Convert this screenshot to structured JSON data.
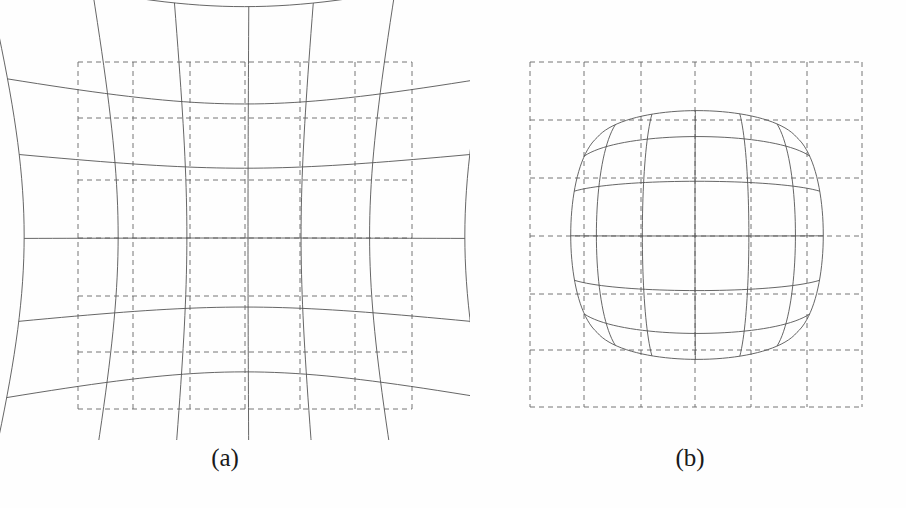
{
  "figure": {
    "background_color": "#fefefe",
    "solid_line_color": "#555555",
    "dashed_line_color": "#666666",
    "caption_color": "#1a1a1a",
    "panels": [
      {
        "id": "a",
        "caption": "(a)",
        "distortion_type": "pincushion",
        "description": "Pincushion distortion grid: solid curved grid bows inward toward the centre, overlaid on dashed ideal rectangular reference grid",
        "reference_grid": {
          "style": "dashed",
          "x_lines": [
            78,
            133,
            190,
            245,
            300,
            355,
            412
          ],
          "y_lines": [
            62,
            118,
            180,
            238,
            296,
            352,
            409
          ]
        },
        "distorted_grid": {
          "style": "solid",
          "nominal_x_lines": [
            62,
            128,
            188,
            248,
            300,
            360,
            427
          ],
          "nominal_y_lines": [
            48,
            115,
            170,
            238,
            305,
            360,
            424
          ],
          "corners": {
            "top_left": [
              48,
              32
            ],
            "top_right": [
              444,
              34
            ],
            "bottom_left": [
              50,
              430
            ],
            "bottom_right": [
              443,
              430
            ]
          },
          "distortion_coefficient": 0.22
        }
      },
      {
        "id": "b",
        "caption": "(b)",
        "distortion_type": "barrel",
        "description": "Barrel distortion grid: solid curved grid bulges outward from the centre, overlaid on dashed ideal rectangular reference grid",
        "reference_grid": {
          "style": "dashed",
          "x_lines": [
            530,
            584,
            641,
            695,
            751,
            807,
            862
          ],
          "y_lines": [
            62,
            120,
            178,
            236,
            294,
            350,
            407
          ]
        },
        "distorted_grid": {
          "style": "solid",
          "nominal_x_lines": [
            543,
            586,
            641,
            695,
            750,
            805,
            851
          ],
          "nominal_y_lines": [
            85,
            127,
            180,
            236,
            292,
            343,
            385
          ],
          "distortion_coefficient": -0.18
        }
      }
    ]
  },
  "chart_data": {
    "type": "diagram",
    "title": "",
    "subtitle": "",
    "panels": [
      {
        "label": "(a)",
        "name": "Pincushion distortion",
        "grid_divisions_x": 6,
        "grid_divisions_y": 6,
        "ideal_grid_lines_x": 7,
        "ideal_grid_lines_y": 7,
        "radial_distortion_k1": 0.22,
        "edge_bow_direction": "inward"
      },
      {
        "label": "(b)",
        "name": "Barrel distortion",
        "grid_divisions_x": 6,
        "grid_divisions_y": 6,
        "ideal_grid_lines_x": 7,
        "ideal_grid_lines_y": 7,
        "radial_distortion_k1": -0.18,
        "edge_bow_direction": "outward"
      }
    ],
    "legend": [
      {
        "style": "solid",
        "meaning": "distorted image grid"
      },
      {
        "style": "dashed",
        "meaning": "ideal / undistorted reference grid"
      }
    ],
    "xlabel": "",
    "ylabel": ""
  }
}
